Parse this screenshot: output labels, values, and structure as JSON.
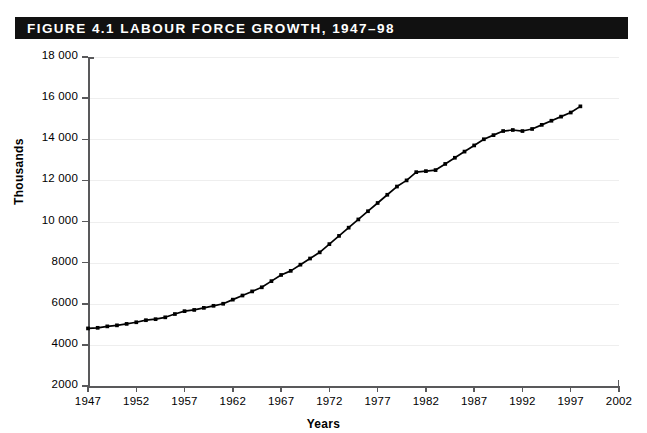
{
  "figure": {
    "banner_label": "FIGURE 4.1   LABOUR FORCE GROWTH, 1947–98",
    "banner_color": "#111111",
    "banner_text_color": "#ffffff",
    "background_color": "#ffffff"
  },
  "chart_data": {
    "type": "line",
    "title": "FIGURE 4.1   LABOUR FORCE GROWTH, 1947–98",
    "xlabel": "Years",
    "ylabel": "Thousands",
    "xlim": [
      1947,
      2002
    ],
    "ylim": [
      2000,
      18000
    ],
    "grid": true,
    "legend": "none",
    "marker": "square",
    "line_color": "#000000",
    "grid_color": "#eeeeee",
    "axis_color": "#59595b",
    "ytick_labels": [
      "18 000",
      "16 000",
      "14 000",
      "12 000",
      "10 000",
      "8000",
      "6000",
      "4000",
      "2000"
    ],
    "ytick_values": [
      18000,
      16000,
      14000,
      12000,
      10000,
      8000,
      6000,
      4000,
      2000
    ],
    "xtick_labels": [
      "1947",
      "1952",
      "1957",
      "1962",
      "1967",
      "1972",
      "1977",
      "1982",
      "1987",
      "1992",
      "1997",
      "2002"
    ],
    "xtick_values": [
      1947,
      1952,
      1957,
      1962,
      1967,
      1972,
      1977,
      1982,
      1987,
      1992,
      1997,
      2002
    ],
    "series": [
      {
        "name": "Labour force",
        "x": [
          1947,
          1948,
          1949,
          1950,
          1951,
          1952,
          1953,
          1954,
          1955,
          1956,
          1957,
          1958,
          1959,
          1960,
          1961,
          1962,
          1963,
          1964,
          1965,
          1966,
          1967,
          1968,
          1969,
          1970,
          1971,
          1972,
          1973,
          1974,
          1975,
          1976,
          1977,
          1978,
          1979,
          1980,
          1981,
          1982,
          1983,
          1984,
          1985,
          1986,
          1987,
          1988,
          1989,
          1990,
          1991,
          1992,
          1993,
          1994,
          1995,
          1996,
          1997,
          1998
        ],
        "values": [
          4800,
          4830,
          4900,
          4950,
          5020,
          5100,
          5200,
          5250,
          5340,
          5500,
          5640,
          5700,
          5800,
          5900,
          6000,
          6200,
          6400,
          6600,
          6800,
          7100,
          7400,
          7600,
          7900,
          8200,
          8500,
          8900,
          9300,
          9700,
          10100,
          10500,
          10900,
          11300,
          11700,
          12000,
          12400,
          12450,
          12500,
          12800,
          13100,
          13400,
          13700,
          14000,
          14200,
          14400,
          14450,
          14400,
          14500,
          14700,
          14900,
          15100,
          15300,
          15600
        ]
      }
    ]
  },
  "axis_titles": {
    "y": "Thousands",
    "x": "Years"
  }
}
